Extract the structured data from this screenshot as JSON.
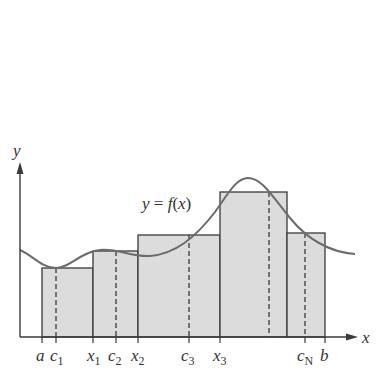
{
  "diagram": {
    "curve_label": "y = f(x)",
    "axis_labels": {
      "x": "x",
      "y": "y"
    },
    "colors": {
      "axis": "#3a3a3a",
      "curve": "#6b6b6b",
      "rect_fill": "#dcdcdc",
      "rect_stroke": "#3a3a3a",
      "dashed": "#3a3a3a"
    },
    "tick_labels": [
      {
        "base": "a",
        "sub": "",
        "x": 42
      },
      {
        "base": "c",
        "sub": "1",
        "x": 56
      },
      {
        "base": "x",
        "sub": "1",
        "x": 93
      },
      {
        "base": "c",
        "sub": "2",
        "x": 116
      },
      {
        "base": "x",
        "sub": "2",
        "x": 138
      },
      {
        "base": "c",
        "sub": "3",
        "x": 189
      },
      {
        "base": "x",
        "sub": "3",
        "x": 220
      },
      {
        "base": "c",
        "sub": "N",
        "x": 305
      },
      {
        "base": "b",
        "sub": "",
        "x": 325
      }
    ],
    "rectangles": [
      {
        "x0": 42,
        "x1": 93,
        "top": 268,
        "sample": 56
      },
      {
        "x0": 93,
        "x1": 138,
        "top": 251,
        "sample": 116
      },
      {
        "x0": 138,
        "x1": 220,
        "top": 235,
        "sample": 189
      },
      {
        "x0": 220,
        "x1": 287,
        "top": 192,
        "sample": 269
      },
      {
        "x0": 287,
        "x1": 325,
        "top": 233,
        "sample": 305
      }
    ]
  }
}
